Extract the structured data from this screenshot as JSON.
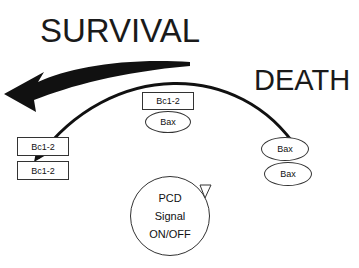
{
  "labels": {
    "survival": "SURVIVAL",
    "death": "DEATH"
  },
  "center": {
    "box": "Bc1-2",
    "ellipse": "Bax"
  },
  "left": {
    "boxes": [
      "Bc1-2",
      "Bc1-2"
    ]
  },
  "right": {
    "ellipses": [
      "Bax",
      "Bax"
    ]
  },
  "signal": {
    "line1": "PCD",
    "line2": "Signal",
    "line3": "ON/OFF"
  }
}
